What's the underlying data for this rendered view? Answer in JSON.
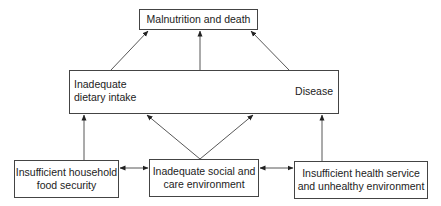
{
  "diagram": {
    "type": "causal-framework",
    "nodes": {
      "top": {
        "label": "Malnutrition and death"
      },
      "middle": {
        "left_label_line1": "Inadequate",
        "left_label_line2": "dietary intake",
        "right_label": "Disease"
      },
      "bottom_left": {
        "line1": "Insufficient household",
        "line2": "food security"
      },
      "bottom_middle": {
        "line1": "Inadequate social and",
        "line2": "care environment"
      },
      "bottom_right": {
        "line1": "Insufficient health service",
        "line2": "and unhealthy environment"
      }
    },
    "edges": [
      {
        "from": "Inadequate dietary intake",
        "to": "Malnutrition and death",
        "type": "arrow"
      },
      {
        "from": "Disease",
        "to": "Malnutrition and death",
        "type": "arrow"
      },
      {
        "from": "Inadequate dietary intake / Disease interaction",
        "to": "Malnutrition and death",
        "type": "arrow"
      },
      {
        "from": "Inadequate dietary intake",
        "to": "Disease",
        "type": "bidirectional"
      },
      {
        "from": "Insufficient household food security",
        "to": "Inadequate dietary intake",
        "type": "arrow"
      },
      {
        "from": "Inadequate social and care environment",
        "to": "Inadequate dietary intake",
        "type": "arrow"
      },
      {
        "from": "Inadequate social and care environment",
        "to": "Disease",
        "type": "arrow"
      },
      {
        "from": "Insufficient health service and unhealthy environment",
        "to": "Disease",
        "type": "arrow"
      },
      {
        "from": "Insufficient household food security",
        "to": "Inadequate social and care environment",
        "type": "bidirectional"
      },
      {
        "from": "Inadequate social and care environment",
        "to": "Insufficient health service and unhealthy environment",
        "type": "bidirectional"
      }
    ],
    "colors": {
      "line": "#333333",
      "box_border": "#444444",
      "text": "#222222",
      "background": "#ffffff"
    }
  }
}
